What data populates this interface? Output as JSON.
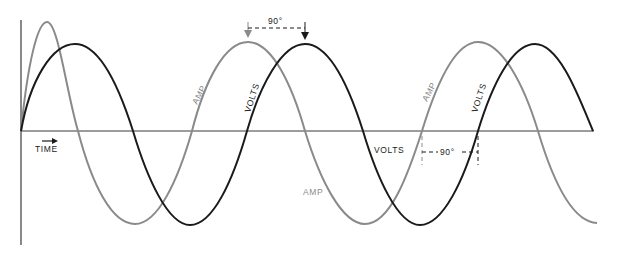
{
  "diagram": {
    "title": "",
    "labels": {
      "time": "TIME",
      "amp_1": "AMP",
      "volts_1": "VOLTS",
      "volts_2": "VOLTS",
      "amp_2": "AMP",
      "amp_3": "AMP",
      "volts_3": "VOLTS",
      "phase_top": "90°",
      "phase_bottom": "90°"
    },
    "colors": {
      "volts": "#1a1a1a",
      "amp": "#8a8a8a",
      "axis": "#3a3a3a"
    },
    "series": [
      {
        "name": "VOLTS",
        "description": "voltage sine wave (black)"
      },
      {
        "name": "AMP",
        "description": "current sine wave (gray), leads voltage by 90°"
      }
    ]
  }
}
